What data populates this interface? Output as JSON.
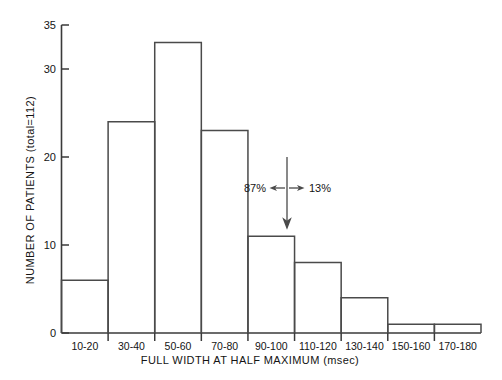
{
  "chart_data": {
    "type": "bar",
    "title": "",
    "subtitle": "",
    "xlabel": "FULL WIDTH AT HALF MAXIMUM (msec)",
    "ylabel": "NUMBER OF PATIENTS (total=112)",
    "categories": [
      "10-20",
      "30-40",
      "50-60",
      "70-80",
      "90-100",
      "110-120",
      "130-140",
      "150-160",
      "170-180"
    ],
    "values": [
      6,
      24,
      33,
      23,
      11,
      8,
      4,
      1,
      1
    ],
    "ylim": [
      0,
      35
    ],
    "yticks": [
      0,
      10,
      20,
      30,
      35
    ],
    "ytick_labels": [
      "0",
      "10",
      "20",
      "30",
      "35"
    ],
    "grid": false,
    "legend": null,
    "legend_position": "none",
    "bar_style": "outlined-histogram",
    "annotations": [
      {
        "name": "left-fraction",
        "text": "87%",
        "kind": "label-with-left-arrow"
      },
      {
        "name": "right-fraction",
        "text": "13%",
        "kind": "label-with-right-arrow"
      },
      {
        "name": "divider",
        "text": "",
        "kind": "vertical-down-arrow",
        "at_category_boundary": "110-120"
      }
    ]
  },
  "axes": {
    "y_title": "NUMBER OF PATIENTS (total=112)",
    "x_title": "FULL WIDTH AT HALF MAXIMUM (msec)"
  },
  "annotation": {
    "left_percent": "87%",
    "right_percent": "13%"
  }
}
